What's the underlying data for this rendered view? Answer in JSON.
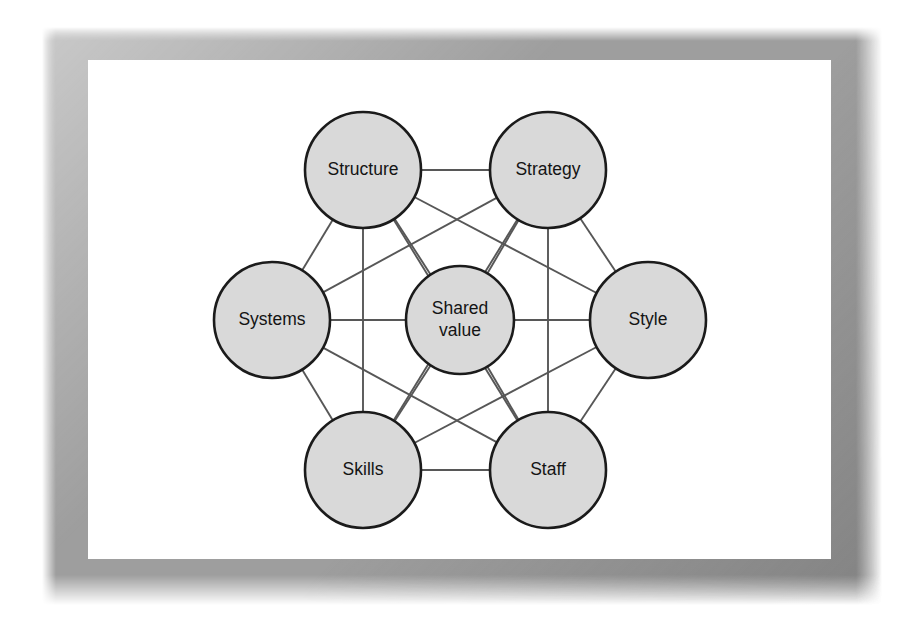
{
  "figure": {
    "frame_color": "#9e9e9e",
    "panel_color": "#ffffff",
    "node_fill": "#d9d9d9",
    "node_stroke": "#1b1b1b",
    "edge_color": "#575757"
  },
  "chart_data": {
    "type": "diagram",
    "layout": "complete-graph-hexagon-with-center",
    "nodes": [
      {
        "id": "structure",
        "label": "Structure",
        "lines": [
          "Structure"
        ],
        "cx": 363,
        "cy": 170,
        "r": 58
      },
      {
        "id": "strategy",
        "label": "Strategy",
        "lines": [
          "Strategy"
        ],
        "cx": 548,
        "cy": 170,
        "r": 58
      },
      {
        "id": "systems",
        "label": "Systems",
        "lines": [
          "Systems"
        ],
        "cx": 272,
        "cy": 320,
        "r": 58
      },
      {
        "id": "shared-value",
        "label": "Shared value",
        "lines": [
          "Shared",
          "value"
        ],
        "cx": 460,
        "cy": 320,
        "r": 54
      },
      {
        "id": "style",
        "label": "Style",
        "lines": [
          "Style"
        ],
        "cx": 648,
        "cy": 320,
        "r": 58
      },
      {
        "id": "skills",
        "label": "Skills",
        "lines": [
          "Skills"
        ],
        "cx": 363,
        "cy": 470,
        "r": 58
      },
      {
        "id": "staff",
        "label": "Staff",
        "lines": [
          "Staff"
        ],
        "cx": 548,
        "cy": 470,
        "r": 58
      }
    ],
    "edges": [
      [
        "structure",
        "strategy"
      ],
      [
        "structure",
        "systems"
      ],
      [
        "structure",
        "shared-value"
      ],
      [
        "structure",
        "style"
      ],
      [
        "structure",
        "skills"
      ],
      [
        "structure",
        "staff"
      ],
      [
        "strategy",
        "systems"
      ],
      [
        "strategy",
        "shared-value"
      ],
      [
        "strategy",
        "style"
      ],
      [
        "strategy",
        "skills"
      ],
      [
        "strategy",
        "staff"
      ],
      [
        "systems",
        "shared-value"
      ],
      [
        "systems",
        "style"
      ],
      [
        "systems",
        "skills"
      ],
      [
        "systems",
        "staff"
      ],
      [
        "shared-value",
        "style"
      ],
      [
        "shared-value",
        "skills"
      ],
      [
        "shared-value",
        "staff"
      ],
      [
        "style",
        "skills"
      ],
      [
        "style",
        "staff"
      ],
      [
        "skills",
        "staff"
      ]
    ]
  }
}
